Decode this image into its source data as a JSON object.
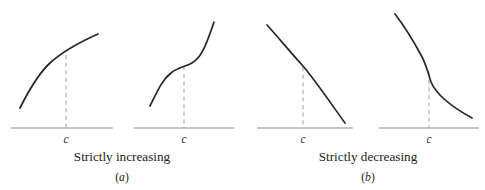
{
  "figure": {
    "background_color": "#ffffff",
    "curve_color": "#26262b",
    "axis_color": "#8b8b90",
    "dashed_color": "#a9a9ad",
    "text_color": "#1d1d21",
    "width": 485,
    "height": 190
  },
  "groups": [
    {
      "id": "a",
      "caption": "Strictly increasing",
      "letter_open": "(",
      "letter": "a",
      "letter_close": ")",
      "caption_x": 122,
      "caption_y": 161,
      "letter_x": 122,
      "letter_y": 181
    },
    {
      "id": "b",
      "caption": "Strictly decreasing",
      "letter_open": "(",
      "letter": "b",
      "letter_close": ")",
      "caption_x": 368,
      "caption_y": 161,
      "letter_x": 368,
      "letter_y": 181
    }
  ],
  "panels": [
    {
      "id": "panel-1",
      "group": "a",
      "behavior": "strictly increasing",
      "shape": "concave increasing curve",
      "tick_label": "c",
      "tick_label_x": 66,
      "tick_label_y": 143,
      "axis": {
        "x1": 11,
        "y1": 128,
        "x2": 113,
        "y2": 128
      },
      "dashed": {
        "x": 66,
        "y_top": 55,
        "y_bottom": 128
      },
      "curve_path": "M 20,108 C 29,90 38,74 50,63 C 62,52 80,42 98,34"
    },
    {
      "id": "panel-2",
      "group": "a",
      "behavior": "strictly increasing",
      "shape": "S-shaped increasing curve with flat inflection at c",
      "tick_label": "c",
      "tick_label_x": 184,
      "tick_label_y": 143,
      "axis": {
        "x1": 134,
        "y1": 128,
        "x2": 234,
        "y2": 128
      },
      "dashed": {
        "x": 184,
        "y_top": 66,
        "y_bottom": 128
      },
      "curve_path": "M 150,106 C 157,92 162,80 171,73 C 178,67 185,67 192,63 C 201,58 206,46 214,22"
    },
    {
      "id": "panel-3",
      "group": "b",
      "behavior": "strictly decreasing",
      "shape": "decreasing curve with a corner (kink) at c",
      "tick_label": "c",
      "tick_label_x": 303,
      "tick_label_y": 143,
      "axis": {
        "x1": 257,
        "y1": 128,
        "x2": 353,
        "y2": 128
      },
      "dashed": {
        "x": 303,
        "y_top": 67,
        "y_bottom": 128
      },
      "curve_path": "M 267,25 C 278,37 291,53 303,66 C 315,80 332,105 345,123"
    },
    {
      "id": "panel-4",
      "group": "b",
      "behavior": "strictly decreasing",
      "shape": "reverse S-shaped decreasing curve, steep at c",
      "tick_label": "c",
      "tick_label_x": 429,
      "tick_label_y": 143,
      "axis": {
        "x1": 379,
        "y1": 128,
        "x2": 479,
        "y2": 128
      },
      "dashed": {
        "x": 429,
        "y_top": 72,
        "y_bottom": 128
      },
      "curve_path": "M 395,14 C 405,27 414,42 421,55 C 426,64 428,72 431,82 C 436,94 452,107 472,118"
    }
  ]
}
